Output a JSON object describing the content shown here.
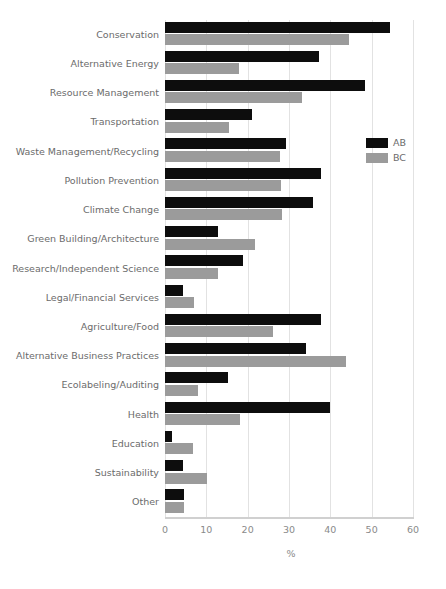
{
  "chart_data": {
    "type": "bar",
    "orientation": "horizontal",
    "title": "",
    "xlabel": "%",
    "ylabel": "",
    "xlim": [
      0,
      60
    ],
    "xticks": [
      0,
      10,
      20,
      30,
      40,
      50,
      60
    ],
    "grid": true,
    "legend_position": "right",
    "categories": [
      "Conservation",
      "Alternative Energy",
      "Resource Management",
      "Transportation",
      "Waste Management/Recycling",
      "Pollution Prevention",
      "Climate Change",
      "Green Building/Architecture",
      "Research/Independent Science",
      "Legal/Financial Services",
      "Agriculture/Food",
      "Alternative Business Practices",
      "Ecolabeling/Auditing",
      "Health",
      "Education",
      "Sustainability",
      "Other"
    ],
    "series": [
      {
        "name": "AB",
        "color": "#0d0d0d",
        "values": [
          54.5,
          37.3,
          48.4,
          21.0,
          29.3,
          37.8,
          35.8,
          12.9,
          18.9,
          4.4,
          37.8,
          34.1,
          15.3,
          39.8,
          1.8,
          4.4,
          4.5
        ]
      },
      {
        "name": "BC",
        "color": "#9b9b9b",
        "values": [
          44.6,
          17.9,
          33.2,
          15.5,
          27.8,
          28.1,
          28.3,
          21.8,
          12.9,
          7.0,
          26.1,
          43.8,
          7.9,
          18.2,
          6.7,
          10.2,
          4.5
        ]
      }
    ]
  },
  "legend": {
    "entries": [
      {
        "label": "AB",
        "color": "#0d0d0d"
      },
      {
        "label": "BC",
        "color": "#9b9b9b"
      }
    ]
  },
  "axis": {
    "x_label": "%",
    "tick_labels": [
      "0",
      "10",
      "20",
      "30",
      "40",
      "50",
      "60"
    ]
  }
}
